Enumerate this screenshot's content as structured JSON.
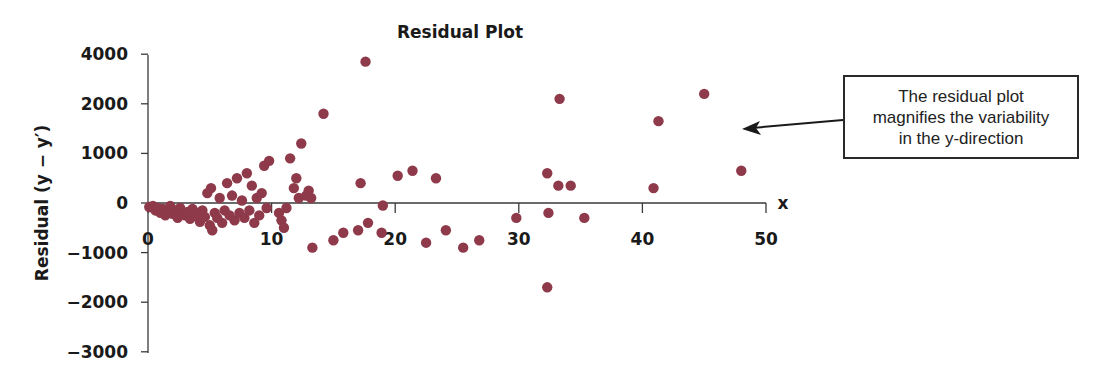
{
  "chart_data": {
    "type": "scatter",
    "title": "Residual Plot",
    "xlabel": "x",
    "ylabel": "Residual (y − y′)",
    "xlim": [
      0,
      50
    ],
    "ylim": [
      -3000,
      4000
    ],
    "x_ticks": [
      0,
      10,
      20,
      30,
      40,
      50
    ],
    "y_ticks": [
      4000,
      2000,
      1000,
      0,
      -1000,
      -2000,
      -3000
    ],
    "grid": false,
    "legend": null,
    "marker_color": "#8e3a4a",
    "annotation": {
      "lines": [
        "The residual plot",
        "magnifies the variability",
        "in the  y-direction"
      ],
      "arrow_to": "plot area (right side)"
    },
    "series": [
      {
        "name": "residuals",
        "points": [
          [
            0.1,
            -80
          ],
          [
            0.4,
            -60
          ],
          [
            0.6,
            -150
          ],
          [
            0.8,
            -100
          ],
          [
            1.0,
            -200
          ],
          [
            1.2,
            -120
          ],
          [
            1.4,
            -250
          ],
          [
            1.6,
            -180
          ],
          [
            1.8,
            -60
          ],
          [
            2.0,
            -220
          ],
          [
            2.2,
            -150
          ],
          [
            2.4,
            -300
          ],
          [
            2.6,
            -100
          ],
          [
            2.8,
            -200
          ],
          [
            3.0,
            -250
          ],
          [
            3.2,
            -180
          ],
          [
            3.4,
            -320
          ],
          [
            3.6,
            -120
          ],
          [
            3.8,
            -260
          ],
          [
            4.0,
            -200
          ],
          [
            4.2,
            -380
          ],
          [
            4.4,
            -150
          ],
          [
            4.6,
            -280
          ],
          [
            4.8,
            200
          ],
          [
            5.0,
            -450
          ],
          [
            5.1,
            300
          ],
          [
            5.2,
            -550
          ],
          [
            5.4,
            -200
          ],
          [
            5.6,
            -300
          ],
          [
            5.8,
            100
          ],
          [
            6.0,
            -400
          ],
          [
            6.2,
            -150
          ],
          [
            6.4,
            400
          ],
          [
            6.6,
            -250
          ],
          [
            6.8,
            150
          ],
          [
            7.0,
            -350
          ],
          [
            7.2,
            500
          ],
          [
            7.4,
            -200
          ],
          [
            7.6,
            50
          ],
          [
            7.8,
            -300
          ],
          [
            8.0,
            600
          ],
          [
            8.2,
            -150
          ],
          [
            8.4,
            350
          ],
          [
            8.6,
            -400
          ],
          [
            8.8,
            100
          ],
          [
            9.0,
            -250
          ],
          [
            9.2,
            200
          ],
          [
            9.4,
            750
          ],
          [
            9.6,
            -100
          ],
          [
            9.8,
            850
          ],
          [
            10.6,
            -200
          ],
          [
            10.8,
            -350
          ],
          [
            11.0,
            -500
          ],
          [
            11.2,
            -100
          ],
          [
            11.5,
            900
          ],
          [
            11.8,
            300
          ],
          [
            12.0,
            500
          ],
          [
            12.2,
            100
          ],
          [
            12.4,
            1200
          ],
          [
            12.8,
            150
          ],
          [
            13.0,
            250
          ],
          [
            13.2,
            100
          ],
          [
            14.2,
            1800
          ],
          [
            17.6,
            3700
          ],
          [
            17.2,
            400
          ],
          [
            19.0,
            -50
          ],
          [
            13.3,
            -900
          ],
          [
            15.0,
            -750
          ],
          [
            15.8,
            -600
          ],
          [
            17.0,
            -550
          ],
          [
            17.8,
            -400
          ],
          [
            18.9,
            -600
          ],
          [
            20.2,
            550
          ],
          [
            21.4,
            650
          ],
          [
            23.3,
            500
          ],
          [
            22.5,
            -800
          ],
          [
            24.1,
            -550
          ],
          [
            25.5,
            -900
          ],
          [
            26.8,
            -750
          ],
          [
            29.8,
            -300
          ],
          [
            32.3,
            600
          ],
          [
            32.4,
            -200
          ],
          [
            32.3,
            -1700
          ],
          [
            33.2,
            350
          ],
          [
            33.3,
            2200
          ],
          [
            34.2,
            350
          ],
          [
            35.3,
            -300
          ],
          [
            40.9,
            300
          ],
          [
            41.3,
            1650
          ],
          [
            45.0,
            2400
          ],
          [
            48.0,
            650
          ]
        ]
      }
    ]
  },
  "chart_text": {
    "title": "Residual Plot",
    "ylabel": "Residual (y − y′)",
    "xlabel": "x",
    "y_ticks": [
      "4000",
      "2000",
      "1000",
      "0",
      "−1000",
      "−2000",
      "−3000"
    ],
    "x_ticks": [
      "0",
      "10",
      "20",
      "30",
      "40",
      "50"
    ],
    "callout_lines": [
      "The residual plot",
      "magnifies the variability",
      "in the  y-direction"
    ]
  }
}
